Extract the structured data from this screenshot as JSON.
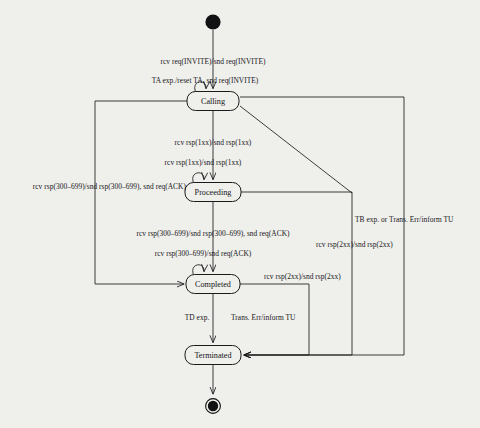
{
  "diagram": {
    "type": "state-machine",
    "background_color": "#efefeb",
    "line_color": "#1b1b1e",
    "text_color": "#17171a",
    "nodes": [
      {
        "id": "initial",
        "kind": "initial-node",
        "label": "",
        "cx": 213,
        "cy": 22,
        "r": 8
      },
      {
        "id": "calling",
        "kind": "state",
        "label": "Calling",
        "cx": 213,
        "cy": 101,
        "w": 52,
        "h": 19
      },
      {
        "id": "proceeding",
        "kind": "state",
        "label": "Proceeding",
        "cx": 213,
        "cy": 192,
        "w": 56,
        "h": 19
      },
      {
        "id": "completed",
        "kind": "state",
        "label": "Completed",
        "cx": 213,
        "cy": 284,
        "w": 54,
        "h": 19
      },
      {
        "id": "terminated",
        "kind": "state",
        "label": "Terminated",
        "cx": 213,
        "cy": 355,
        "w": 56,
        "h": 19
      },
      {
        "id": "final",
        "kind": "final-node",
        "label": "",
        "cx": 213,
        "cy": 406,
        "r": 8
      }
    ],
    "transitions": [
      {
        "id": "t-init-calling",
        "from": "initial",
        "to": "calling",
        "label": "rcv req(INVITE)/snd req(INVITE)",
        "lx": 213,
        "ly": 58,
        "align": "center"
      },
      {
        "id": "t-calling-self",
        "from": "calling",
        "to": "calling",
        "label": "TA exp./reset TA, snd req(INVITE)",
        "lx": 205,
        "ly": 77,
        "align": "center"
      },
      {
        "id": "t-calling-proceeding",
        "from": "calling",
        "to": "proceeding",
        "label": "rcv rsp(1xx)/snd rsp(1xx)",
        "lx": 213,
        "ly": 139,
        "align": "center"
      },
      {
        "id": "t-proceeding-self",
        "from": "proceeding",
        "to": "proceeding",
        "label": "rcv rsp(1xx)/snd rsp(1xx)",
        "lx": 203,
        "ly": 159,
        "align": "center"
      },
      {
        "id": "t-calling-completed",
        "from": "calling",
        "to": "completed",
        "label": "rcv rsp(300–699)/snd rsp(300–699), snd req(ACK)",
        "lx": 186,
        "ly": 183,
        "align": "right"
      },
      {
        "id": "t-proc-completed",
        "from": "proceeding",
        "to": "completed",
        "label": "rcv rsp(300–699)/snd rsp(300–699), snd req(ACK)",
        "lx": 213,
        "ly": 230,
        "align": "center"
      },
      {
        "id": "t-completed-self",
        "from": "completed",
        "to": "completed",
        "label": "rcv rsp(300–699)/snd req(ACK)",
        "lx": 203,
        "ly": 250,
        "align": "center"
      },
      {
        "id": "t-proc-terminated",
        "from": "proceeding",
        "to": "terminated",
        "label": "rcv rsp(2xx)/snd rsp(2xx)",
        "lx": 316,
        "ly": 241,
        "align": "left"
      },
      {
        "id": "t-calling-terminated",
        "from": "calling",
        "to": "terminated",
        "label": "rcv rsp(2xx)/snd rsp(2xx)",
        "lx": 264,
        "ly": 273,
        "align": "left"
      },
      {
        "id": "t-tb-terminated",
        "from": "calling",
        "to": "terminated",
        "label": "TB exp. or Trans. Err/inform TU",
        "lx": 355,
        "ly": 216,
        "align": "left"
      },
      {
        "id": "t-completed-td",
        "from": "completed",
        "to": "terminated",
        "label": "TD exp.",
        "lx": 197,
        "ly": 314,
        "align": "center"
      },
      {
        "id": "t-completed-err",
        "from": "completed",
        "to": "terminated",
        "label": "Trans. Err/inform TU",
        "lx": 231,
        "ly": 314,
        "align": "left"
      }
    ]
  }
}
